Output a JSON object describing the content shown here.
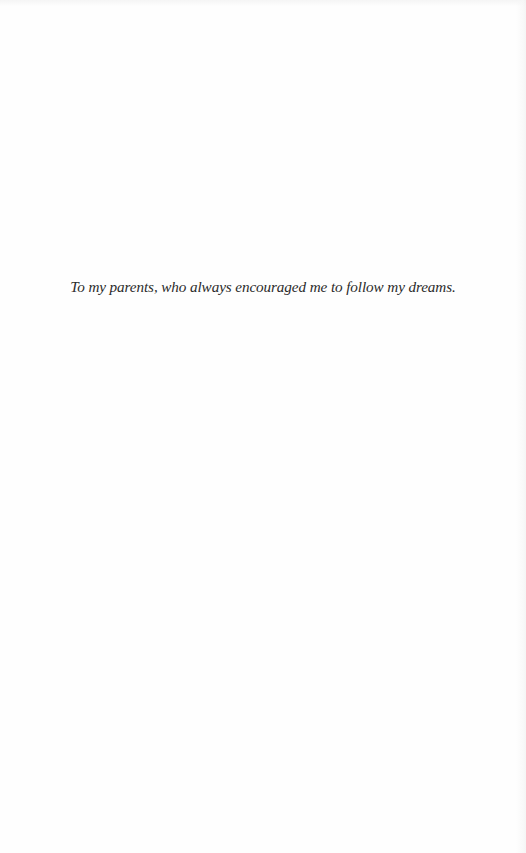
{
  "page": {
    "type": "dedication",
    "background_color": "#fefefe",
    "text_color": "#2b2b2b"
  },
  "dedication": {
    "text": "To my parents, who always encouraged me to follow my dreams."
  }
}
